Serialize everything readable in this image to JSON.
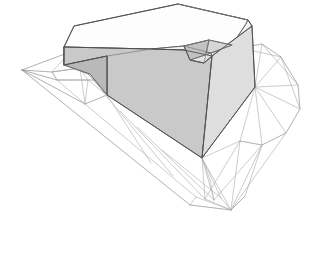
{
  "scene": {
    "title": "Architectural Massing Render",
    "subject": "angular-building-volume-on-terrain-mesh",
    "background_color": "#ffffff",
    "canvas": {
      "width": 330,
      "height": 271
    },
    "projection": "axonometric"
  },
  "palette": {
    "background": "#ffffff",
    "top_face": "#fdfdfd",
    "top_face_shade": "#f2f2f2",
    "front_left_face": "#c9c9c9",
    "front_right_face": "#dedede",
    "notch_face_dark": "#bdbdbd",
    "notch_face_light": "#e6e6e6",
    "edge_stroke": "#4e4e52",
    "terrain_stroke": "#8e8e90",
    "terrain_stroke_faint": "#a9a9ac",
    "terrain_fill": "#ffffff"
  },
  "building": {
    "name": "massing-volume",
    "description": "L-shaped cantilevered slab with recessed triangular notch at right corner",
    "faces": [
      {
        "id": "roof-top",
        "label": "Roof / top face",
        "color": "#fdfdfd",
        "points": "64,47 74,26 178,4 248,20 246,24 232,45 211,53 184,46 151,49"
      },
      {
        "id": "roof-top-shade",
        "label": "Roof shading band",
        "color": "#f4f4f4",
        "points": "151,49 184,46 211,53 232,45 246,24 248,20 252,26 240,48 212,56 184,50"
      },
      {
        "id": "front-left-face",
        "label": "Main left elevation",
        "color": "#c9c9c9",
        "points": "64,47 151,49 184,50 212,56 202,158 107,95 107,56 64,65"
      },
      {
        "id": "front-right-face",
        "label": "Right elevation",
        "color": "#dedede",
        "points": "212,56 252,26 255,87 202,158"
      },
      {
        "id": "notch-face-a",
        "label": "Notch facet upper",
        "color": "#d6d6d6",
        "points": "184,46 211,53 232,45 209,40"
      },
      {
        "id": "notch-face-b",
        "label": "Notch facet inner",
        "color": "#c2c2c2",
        "points": "184,46 209,40 204,63 190,60"
      },
      {
        "id": "notch-face-c",
        "label": "Notch facet lower",
        "color": "#e4e4e4",
        "points": "190,60 204,63 212,56 211,53"
      },
      {
        "id": "cantilever-underside",
        "label": "Cantilever underside",
        "color": "#b9b9b9",
        "points": "64,65 107,56 107,95 90,74"
      }
    ],
    "edges": [
      "M64,47 L74,26 L178,4 L248,20 L252,26 L255,87 L202,158 L107,95 L107,56 L64,65 Z",
      "M64,47 L64,65",
      "M64,47 L151,49 L184,50 L212,56 L252,26",
      "M212,56 L202,158",
      "M107,56 L151,49",
      "M178,4 L248,20",
      "M184,46 L209,40 L232,45",
      "M184,46 L190,60 L204,63 L212,56",
      "M209,40 L204,63",
      "M211,53 L190,60",
      "M184,46 L211,53 L232,45"
    ]
  },
  "terrain": {
    "name": "site-terrain-mesh",
    "description": "Triangulated wireframe contour mesh of sloping site, rendered as white faces with thin gray edges",
    "left_patch_edges": [
      "M22,70 L70,52 L96,54 L107,56",
      "M22,70 L52,72 L80,68 L104,70",
      "M22,70 L57,80 L88,80 L106,80",
      "M22,70 L85,104 L107,95",
      "M70,52 L52,72 L57,80 L85,104",
      "M96,54 L80,68 L88,80 L103,92",
      "M52,72 L80,68",
      "M57,80 L88,80",
      "M70,52 L80,68",
      "M80,68 L85,104",
      "M52,72 L57,80",
      "M88,80 L85,104",
      "M104,70 L106,80 L103,92"
    ],
    "lower_apron_edges": [
      "M22,70 L190,205",
      "M85,104 L196,197 L231,210",
      "M103,92 L173,176",
      "M107,95 L151,163",
      "M120,111 L205,199",
      "M137,127 L214,200",
      "M162,150 L221,198"
    ],
    "right_patch_edges": [
      "M240,48 L262,44 L281,57 L298,85 L300,109 L286,133 L262,145 L240,141",
      "M255,87 L281,57",
      "M255,87 L298,85",
      "M255,87 L300,109",
      "M255,87 L262,44",
      "M240,48 L281,57",
      "M262,44 L298,85",
      "M281,57 L300,109",
      "M262,145 L255,87",
      "M286,133 L255,87",
      "M240,141 L255,87",
      "M231,210 L262,145",
      "M231,210 L240,141",
      "M231,210 L286,133",
      "M205,199 L240,141",
      "M214,200 L262,145",
      "M190,205 L231,210 L245,196",
      "M196,197 L231,210",
      "M221,198 L231,210",
      "M245,196 L262,145",
      "M190,205 L196,197",
      "M202,158 L240,141",
      "M202,158 L214,200",
      "M202,158 L205,199",
      "M202,158 L221,198"
    ],
    "vertices_labels": [
      "west-tip",
      "north-ridge",
      "east-ridge",
      "south-apron",
      "south-east-valley"
    ]
  },
  "annotations": {
    "has_text_labels": false,
    "has_axes": false,
    "has_legend": false,
    "has_scale_bar": false
  }
}
